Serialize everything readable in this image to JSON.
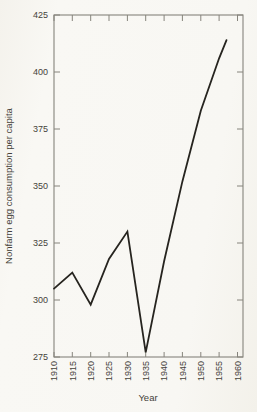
{
  "figure": {
    "background": "#f8f7f3",
    "axis_color": "#86847c",
    "line_color": "#26241f",
    "text_color": "#45423a"
  },
  "chart_data": {
    "type": "line",
    "title": "",
    "xlabel": "Year",
    "ylabel": "Nonfarm egg consumption per capita",
    "series": [
      {
        "name": "Nonfarm egg consumption per capita",
        "points": [
          [
            1910,
            305
          ],
          [
            1915,
            312
          ],
          [
            1920,
            298
          ],
          [
            1925,
            318
          ],
          [
            1930,
            330
          ],
          [
            1935,
            277
          ],
          [
            1940,
            317
          ],
          [
            1945,
            352
          ],
          [
            1950,
            383
          ],
          [
            1955,
            406
          ],
          [
            1957,
            414
          ]
        ]
      }
    ],
    "x_ticks": [
      1910,
      1915,
      1920,
      1925,
      1930,
      1935,
      1940,
      1945,
      1950,
      1955,
      1960
    ],
    "y_ticks": [
      275,
      300,
      325,
      350,
      375,
      400,
      425
    ],
    "xlim": [
      1910,
      1961.5
    ],
    "ylim": [
      275,
      425
    ],
    "grid": false,
    "legend": "none",
    "frame": "box",
    "tick_style": "inward-all-sides"
  }
}
